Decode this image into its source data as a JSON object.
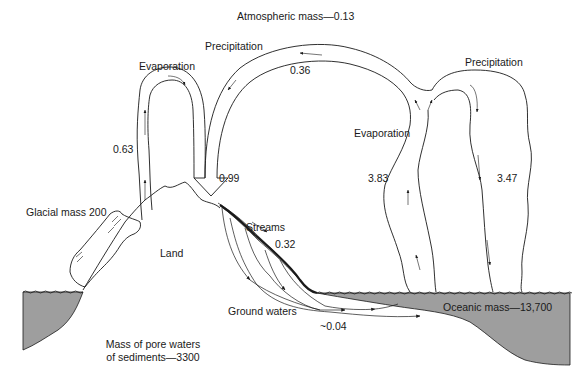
{
  "title": "Atmospheric mass—0.13",
  "colors": {
    "water_fill": "#9e9e9e",
    "line": "#1a1a1a",
    "background": "#ffffff"
  },
  "labels": {
    "atmospheric_mass": "Atmospheric mass—0.13",
    "precipitation_land": "Precipitation",
    "precipitation_land_value": "0.36",
    "evaporation_land": "Evaporation",
    "evaporation_land_value": "0.63",
    "total_land_precip_value": "0.99",
    "precipitation_ocean": "Precipitation",
    "precipitation_ocean_value": "3.47",
    "evaporation_ocean": "Evaporation",
    "evaporation_ocean_value": "3.83",
    "glacial_mass": "Glacial mass 200",
    "land": "Land",
    "streams": "Streams",
    "streams_value": "0.32",
    "ground_waters": "Ground waters",
    "ground_waters_value": "~0.04",
    "oceanic_mass": "Oceanic mass—13,700",
    "pore_waters_line1": "Mass of pore waters",
    "pore_waters_line2": "of sediments—3300"
  }
}
